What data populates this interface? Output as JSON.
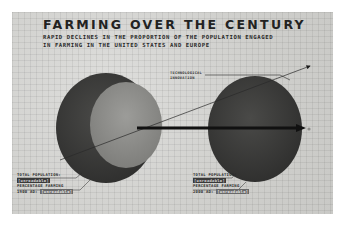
{
  "infographic": {
    "title": "FARMING OVER THE CENTURY",
    "subtitle": "RAPID DECLINES IN THE PROPORTION OF THE POPULATION ENGAGED IN FARMING IN THE UNITED STATES AND EUROPE",
    "arrow_label_line1": "TECHNOLOGICAL",
    "arrow_label_line2": "INNOVATION",
    "left": {
      "population_label": "TOTAL POPULATION:",
      "population_value": "[unreadable]",
      "farming_label": "PERCENTAGE FARMING",
      "year": "1900 AD:",
      "farming_value": "[unreadable]"
    },
    "right": {
      "population_label": "TOTAL POPULATION:",
      "population_value": "[unreadable]",
      "farming_label": "PERCENTAGE FARMING",
      "year": "2000 AD:",
      "farming_value": "[unreadable]"
    },
    "colors": {
      "background": "#d6d6d4",
      "dark_circle": "#3a3a3a",
      "light_circle": "#8e8e8b",
      "text": "#222222"
    }
  }
}
